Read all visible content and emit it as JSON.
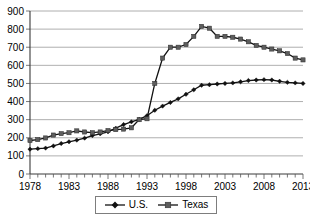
{
  "chart_data": {
    "type": "line",
    "title": "",
    "subtitle": "",
    "xlabel": "",
    "ylabel": "",
    "xlim": [
      1978,
      2013
    ],
    "ylim": [
      0,
      900
    ],
    "grid": true,
    "legend_position": "bottom",
    "y_ticks": [
      0,
      100,
      200,
      300,
      400,
      500,
      600,
      700,
      800,
      900
    ],
    "y_tick_labels": [
      "0",
      "100",
      "200",
      "300",
      "400",
      "500",
      "600",
      "700",
      "800",
      "900"
    ],
    "x_tick_labels": [
      "1978",
      "1983",
      "1988",
      "1993",
      "1998",
      "2003",
      "2008",
      "2013"
    ],
    "x_labeled_years": [
      1978,
      1983,
      1988,
      1993,
      1998,
      2003,
      2008,
      2013
    ],
    "x": [
      1978,
      1979,
      1980,
      1981,
      1982,
      1983,
      1984,
      1985,
      1986,
      1987,
      1988,
      1989,
      1990,
      1991,
      1992,
      1993,
      1994,
      1995,
      1996,
      1997,
      1998,
      1999,
      2000,
      2001,
      2002,
      2003,
      2004,
      2005,
      2006,
      2007,
      2008,
      2009,
      2010,
      2011,
      2012,
      2013
    ],
    "series": [
      {
        "name": "U.S.",
        "marker": "diamond",
        "color": "#111111",
        "values": [
          137,
          140,
          143,
          155,
          168,
          178,
          187,
          198,
          212,
          222,
          233,
          253,
          273,
          288,
          302,
          322,
          352,
          375,
          395,
          415,
          440,
          465,
          490,
          493,
          497,
          500,
          503,
          509,
          516,
          519,
          521,
          519,
          512,
          506,
          503,
          500
        ]
      },
      {
        "name": "Texas",
        "marker": "square",
        "color": "#5d5d5d",
        "values": [
          185,
          190,
          199,
          215,
          223,
          228,
          238,
          232,
          228,
          232,
          240,
          245,
          248,
          255,
          300,
          305,
          500,
          640,
          700,
          700,
          715,
          760,
          815,
          805,
          760,
          760,
          755,
          745,
          730,
          710,
          700,
          690,
          680,
          665,
          640,
          630
        ]
      }
    ]
  },
  "legend": {
    "entries": [
      {
        "label": "U.S.",
        "marker": "diamond"
      },
      {
        "label": "Texas",
        "marker": "square"
      }
    ]
  },
  "colors": {
    "us_series": "#111111",
    "texas_series": "#5d5d5d",
    "gridline": "#9a9a9a",
    "axis": "#3a3a3a",
    "background": "#ffffff"
  }
}
